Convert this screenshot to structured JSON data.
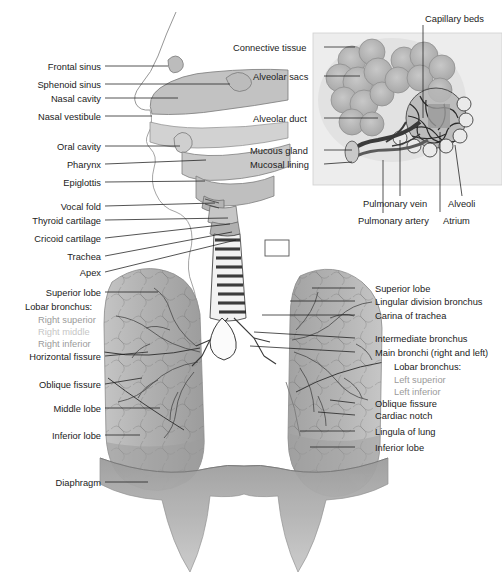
{
  "figure": {
    "background": "#ffffff",
    "line_color": "#1b1b1b",
    "tissue_gray": "#b9b9b9",
    "tissue_gray_dark": "#8f8f8f",
    "label_color": "#1b1b1b",
    "label_color_muted": "#9a9a9a",
    "label_color_faint": "#c6c6c6"
  },
  "labels_left_head": [
    {
      "id": "frontal-sinus",
      "text": "Frontal sinus",
      "x": 30,
      "y": 62,
      "lx1": 105,
      "ly1": 66,
      "lx2": 168,
      "ly2": 66
    },
    {
      "id": "sphenoid-sinus",
      "text": "Sphenoid sinus",
      "x": 17,
      "y": 80,
      "lx1": 105,
      "ly1": 84,
      "lx2": 230,
      "ly2": 84
    },
    {
      "id": "nasal-cavity",
      "text": "Nasal cavity",
      "x": 35,
      "y": 94,
      "lx1": 105,
      "ly1": 98,
      "lx2": 178,
      "ly2": 98
    },
    {
      "id": "nasal-vestibule",
      "text": "Nasal vestibule",
      "x": 17,
      "y": 112,
      "lx1": 105,
      "ly1": 116,
      "lx2": 152,
      "ly2": 116
    },
    {
      "id": "oral-cavity",
      "text": "Oral cavity",
      "x": 40,
      "y": 142,
      "lx1": 105,
      "ly1": 146,
      "lx2": 180,
      "ly2": 146
    },
    {
      "id": "pharynx",
      "text": "Pharynx",
      "x": 55,
      "y": 160,
      "lx1": 105,
      "ly1": 164,
      "lx2": 206,
      "ly2": 160
    },
    {
      "id": "epiglottis",
      "text": "Epiglottis",
      "x": 47,
      "y": 178,
      "lx1": 105,
      "ly1": 182,
      "lx2": 205,
      "ly2": 181
    }
  ],
  "labels_left_airway": [
    {
      "id": "vocal-fold",
      "text": "Vocal fold",
      "x": 43,
      "y": 202,
      "lx1": 105,
      "ly1": 206,
      "lx2": 215,
      "ly2": 203
    },
    {
      "id": "thyroid-cartilage",
      "text": "Thyroid cartilage",
      "x": 14,
      "y": 216,
      "lx1": 105,
      "ly1": 220,
      "lx2": 228,
      "ly2": 218
    },
    {
      "id": "cricoid-cartilage",
      "text": "Cricoid cartilage",
      "x": 14,
      "y": 234,
      "lx1": 105,
      "ly1": 238,
      "lx2": 230,
      "ly2": 224
    },
    {
      "id": "trachea",
      "text": "Trachea",
      "x": 55,
      "y": 252,
      "lx1": 105,
      "ly1": 256,
      "lx2": 232,
      "ly2": 232
    },
    {
      "id": "apex",
      "text": "Apex",
      "x": 68,
      "y": 268,
      "lx1": 105,
      "ly1": 272,
      "lx2": 236,
      "ly2": 240
    }
  ],
  "labels_left_lung": [
    {
      "id": "superior-lobe-right",
      "text": "Superior lobe",
      "x": 30,
      "y": 288,
      "lx1": 105,
      "ly1": 292,
      "lx2": 158,
      "ly2": 292
    },
    {
      "id": "lobar-bronchus-right",
      "text": "Lobar bronchus:",
      "x": 25,
      "y": 302,
      "line": false
    },
    {
      "id": "right-superior",
      "text": "Right superior",
      "x": 38,
      "y": 315,
      "line": false,
      "muted": true
    },
    {
      "id": "right-middle",
      "text": "Right middle",
      "x": 38,
      "y": 327,
      "line": false,
      "faint": true
    },
    {
      "id": "right-inferior",
      "text": "Right inferior",
      "x": 38,
      "y": 339,
      "line": false,
      "muted": true
    },
    {
      "id": "horizontal-fissure",
      "text": "Horizontal fissure",
      "x": 14,
      "y": 352,
      "lx1": 105,
      "ly1": 356,
      "lx2": 148,
      "ly2": 352
    },
    {
      "id": "oblique-fissure-right",
      "text": "Oblique fissure",
      "x": 28,
      "y": 380,
      "lx1": 105,
      "ly1": 384,
      "lx2": 142,
      "ly2": 378
    },
    {
      "id": "middle-lobe",
      "text": "Middle lobe",
      "x": 36,
      "y": 404,
      "lx1": 105,
      "ly1": 408,
      "lx2": 160,
      "ly2": 408
    },
    {
      "id": "inferior-lobe-right",
      "text": "Inferior lobe",
      "x": 33,
      "y": 431,
      "lx1": 105,
      "ly1": 435,
      "lx2": 140,
      "ly2": 435
    },
    {
      "id": "diaphragm",
      "text": "Diaphragm",
      "x": 45,
      "y": 478,
      "lx1": 105,
      "ly1": 482,
      "lx2": 148,
      "ly2": 482
    }
  ],
  "labels_right_lung": [
    {
      "id": "superior-lobe-left",
      "text": "Superior lobe",
      "x": 375,
      "y": 284,
      "lx1": 355,
      "ly1": 288,
      "lx2": 312,
      "ly2": 288
    },
    {
      "id": "lingular-division-bronchus",
      "text": "Lingular division bronchus",
      "x": 375,
      "y": 297,
      "lx1": 355,
      "ly1": 301,
      "lx2": 290,
      "ly2": 301
    },
    {
      "id": "carina-of-trachea",
      "text": "Carina of trachea",
      "x": 375,
      "y": 311,
      "lx1": 355,
      "ly1": 315,
      "lx2": 262,
      "ly2": 315
    },
    {
      "id": "intermediate-bronchus",
      "text": "Intermediate bronchus",
      "x": 375,
      "y": 334,
      "lx1": 355,
      "ly1": 338,
      "lx2": 254,
      "ly2": 332
    },
    {
      "id": "main-bronchi",
      "text": "Main bronchi (right and left)",
      "x": 375,
      "y": 348,
      "lx1": 355,
      "ly1": 352,
      "lx2": 250,
      "ly2": 346
    },
    {
      "id": "lobar-bronchus-left",
      "text": "Lobar bronchus:",
      "x": 394,
      "y": 362,
      "line": false
    },
    {
      "id": "left-superior",
      "text": "Left superior",
      "x": 394,
      "y": 375,
      "line": false,
      "muted": true
    },
    {
      "id": "left-inferior",
      "text": "Left inferior",
      "x": 394,
      "y": 387,
      "line": false,
      "muted": true
    },
    {
      "id": "oblique-fissure-left",
      "text": "Oblique fissure",
      "x": 375,
      "y": 399,
      "lx1": 355,
      "ly1": 403,
      "lx2": 330,
      "ly2": 400
    },
    {
      "id": "cardiac-notch",
      "text": "Cardiac notch",
      "x": 375,
      "y": 411,
      "lx1": 355,
      "ly1": 415,
      "lx2": 318,
      "ly2": 412
    },
    {
      "id": "lingula-of-lung",
      "text": "Lingula of lung",
      "x": 375,
      "y": 427,
      "lx1": 355,
      "ly1": 431,
      "lx2": 300,
      "ly2": 431
    },
    {
      "id": "inferior-lobe-left",
      "text": "Inferior lobe",
      "x": 375,
      "y": 443,
      "lx1": 355,
      "ly1": 447,
      "lx2": 310,
      "ly2": 447
    }
  ],
  "inset": {
    "panel": {
      "x": 313,
      "y": 33,
      "w": 189,
      "h": 152,
      "fill": "#ededed",
      "border": "#cfcfcf"
    },
    "labels": [
      {
        "id": "capillary-beds",
        "text": "Capillary beds",
        "x": 425,
        "y": 14,
        "lx1": 423,
        "ly1": 25,
        "lx2": 423,
        "ly2": 118
      },
      {
        "id": "connective-tissue",
        "text": "Connective tissue",
        "x": 233,
        "y": 43,
        "lx1": 324,
        "ly1": 47,
        "lx2": 355,
        "ly2": 47
      },
      {
        "id": "alveolar-sacs",
        "text": "Alveolar sacs",
        "x": 253,
        "y": 72,
        "lx1": 324,
        "ly1": 76,
        "lx2": 360,
        "ly2": 76
      },
      {
        "id": "alveolar-duct",
        "text": "Alveolar duct",
        "x": 253,
        "y": 114,
        "lx1": 324,
        "ly1": 118,
        "lx2": 378,
        "ly2": 118
      },
      {
        "id": "mucous-gland",
        "text": "Mucous gland",
        "x": 250,
        "y": 146,
        "lx1": 324,
        "ly1": 150,
        "lx2": 352,
        "ly2": 150
      },
      {
        "id": "mucosal-lining",
        "text": "Mucosal lining",
        "x": 250,
        "y": 160,
        "lx1": 324,
        "ly1": 164,
        "lx2": 352,
        "ly2": 162
      },
      {
        "id": "pulmonary-vein",
        "text": "Pulmonary vein",
        "x": 363,
        "y": 199,
        "lx1": 400,
        "ly1": 196,
        "lx2": 400,
        "ly2": 140
      },
      {
        "id": "pulmonary-artery",
        "text": "Pulmonary artery",
        "x": 358,
        "y": 216,
        "lx1": 383,
        "ly1": 213,
        "lx2": 383,
        "ly2": 160
      },
      {
        "id": "atrium",
        "text": "Atrium",
        "x": 443,
        "y": 216,
        "lx1": 440,
        "ly1": 212,
        "lx2": 440,
        "ly2": 132
      },
      {
        "id": "alveoli",
        "text": "Alveoli",
        "x": 448,
        "y": 199,
        "lx1": 462,
        "ly1": 196,
        "lx2": 455,
        "ly2": 145
      }
    ]
  },
  "detail_box": {
    "x": 265,
    "y": 240,
    "w": 24,
    "h": 16
  }
}
